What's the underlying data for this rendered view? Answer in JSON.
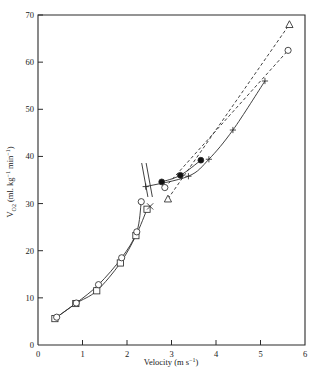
{
  "figure": {
    "width": 322,
    "height": 380,
    "background": "#ffffff",
    "ink_color": "#2b2b2b"
  },
  "axes": {
    "x": {
      "title_text": "Velocity",
      "title_units_open": "(m s",
      "title_units_exp": "−1",
      "title_units_close": ")",
      "title_full": "Velocity (m s−1)",
      "min": 0,
      "max": 6,
      "ticks": [
        0,
        1,
        2,
        3,
        4,
        5,
        6
      ],
      "tick_labels": [
        "0",
        "1",
        "2",
        "3",
        "4",
        "5",
        "6"
      ],
      "pixel_left": 38,
      "pixel_right": 305
    },
    "y": {
      "symbol": "V",
      "symbol_sub": "O",
      "symbol_sub2": "2",
      "units_open": "(ml. kg",
      "units_exp1": "−1",
      "units_mid": " min",
      "units_exp2": "−1",
      "units_close": ")",
      "title_full": "VO2 (ml. kg−1 min−1)",
      "min": 0,
      "max": 70,
      "ticks": [
        0,
        10,
        20,
        30,
        40,
        50,
        60,
        70
      ],
      "tick_labels": [
        "0",
        "10",
        "20",
        "30",
        "40",
        "50",
        "60",
        "70"
      ],
      "pixel_top": 15,
      "pixel_bottom": 345
    }
  },
  "chart_data": {
    "type": "scatter",
    "title": "",
    "subtitle": "",
    "xlabel": "Velocity (m s−1)",
    "ylabel": "VO2 (ml. kg−1 min−1)",
    "xlim": [
      0,
      6
    ],
    "ylim": [
      0,
      70
    ],
    "xticks": [
      0,
      1,
      2,
      3,
      4,
      5,
      6
    ],
    "yticks": [
      0,
      10,
      20,
      30,
      40,
      50,
      60,
      70
    ],
    "grid": false,
    "legend": "none",
    "annotations": [],
    "series": [
      {
        "name": "Walking-running curve A (open squares)",
        "marker": "open-square",
        "line": "solid",
        "x": [
          0.38,
          0.85,
          1.32,
          1.85,
          2.2,
          2.45
        ],
        "y": [
          5.6,
          8.8,
          11.5,
          17.4,
          23.2,
          28.8
        ]
      },
      {
        "name": "Walking-running curve B (open circles)",
        "marker": "open-circle",
        "line": "solid",
        "x": [
          0.42,
          0.86,
          1.36,
          1.88,
          2.22,
          2.32
        ],
        "y": [
          5.9,
          8.9,
          12.8,
          18.5,
          24.0,
          30.4
        ]
      },
      {
        "name": "Running steady-state (filled circles)",
        "marker": "filled-circle",
        "line": "solid",
        "x": [
          2.78,
          3.2,
          3.66
        ],
        "y": [
          34.6,
          36.0,
          39.2
        ]
      },
      {
        "name": "Running (open circles, dashed)",
        "marker": "open-circle",
        "line": "dashed",
        "x": [
          2.85,
          5.62
        ],
        "y": [
          33.4,
          62.5
        ]
      },
      {
        "name": "Running (open triangles, dashed)",
        "marker": "open-triangle",
        "line": "dashed",
        "x": [
          2.92,
          5.65
        ],
        "y": [
          31.0,
          68.0
        ]
      },
      {
        "name": "Regression (plus markers, solid)",
        "marker": "plus",
        "line": "solid",
        "x": [
          2.42,
          3.38,
          3.84,
          4.38,
          5.1
        ],
        "y": [
          33.6,
          35.8,
          39.4,
          45.6,
          56.0
        ]
      },
      {
        "name": "Transition marker (X)",
        "marker": "cross",
        "line": "none",
        "x": [
          2.52
        ],
        "y": [
          29.4
        ]
      }
    ],
    "reference_lines": [
      {
        "name": "vertical transition line 1",
        "x1": 2.33,
        "y1": 38.6,
        "x2": 2.47,
        "y2": 31.4,
        "style": "solid"
      },
      {
        "name": "vertical transition line 2",
        "x1": 2.43,
        "y1": 38.6,
        "x2": 2.57,
        "y2": 31.4,
        "style": "solid"
      }
    ]
  }
}
